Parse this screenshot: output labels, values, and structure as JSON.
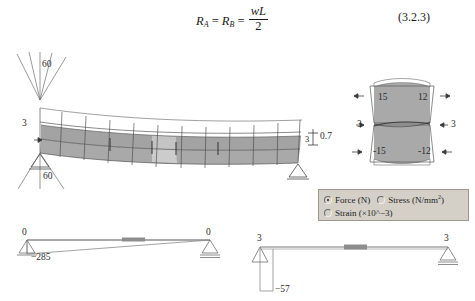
{
  "equation": {
    "lhs_1": "R",
    "lhs_1_sub": "A",
    "eq_1": "=",
    "lhs_2": "R",
    "lhs_2_sub": "B",
    "eq_2": "=",
    "frac_num": "wL",
    "frac_den": "2",
    "number": "(3.2.3)"
  },
  "beam_view": {
    "load_fan_top_label": "60",
    "load_fan_bottom_label": "60",
    "left_reaction_label": "3",
    "right_dim_label": "3",
    "right_dim_label_2": "0.7"
  },
  "cross_section": {
    "top_left_value": "15",
    "top_right_value": "12",
    "bottom_left_value": "-15",
    "bottom_right_value": "-12",
    "mid_left_value": "3",
    "mid_right_value": "3"
  },
  "legend": {
    "options": [
      {
        "label_html": "Force (N)",
        "selected": true
      },
      {
        "label_html": "Stress (N/mm<sup>2</sup>)",
        "selected": false
      },
      {
        "label_html": "Strain (×10^−3)",
        "selected": false
      }
    ]
  },
  "diagram_axial": {
    "left_end_value": "0",
    "right_end_value": "0",
    "peak_value": "−285"
  },
  "diagram_shear": {
    "left_end_value": "3",
    "right_end_value": "3",
    "peak_value": "−57"
  },
  "colors": {
    "mesh_fill": "#a9a9a9",
    "mesh_fill_light": "#c9c9c9",
    "mesh_line": "#4a4a4a",
    "outline": "#7a7a7a",
    "panel_bg": "#d4d0c8",
    "panel_border": "#9b978f",
    "highlight_bar": "#8d8d8d",
    "text": "#2b2b2b"
  }
}
